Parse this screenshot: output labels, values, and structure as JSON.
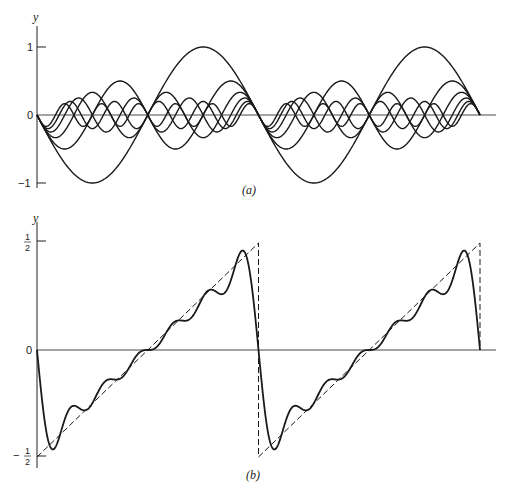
{
  "chart_data": [
    {
      "panel": "a",
      "type": "line",
      "title": "",
      "caption": "(a)",
      "ylabel": "y",
      "xlabel": "",
      "yticks": [
        "1",
        "0",
        "-1"
      ],
      "ylim": [
        -1,
        1
      ],
      "xlim_periods": 2,
      "description": "Fourier components of the sawtooth: y = -sin(n x)/n for n = 1..6 over two periods",
      "series": [
        {
          "name": "n=1",
          "n": 1,
          "amplitude": 1.0
        },
        {
          "name": "n=2",
          "n": 2,
          "amplitude": 0.5
        },
        {
          "name": "n=3",
          "n": 3,
          "amplitude": 0.333
        },
        {
          "name": "n=4",
          "n": 4,
          "amplitude": 0.25
        },
        {
          "name": "n=5",
          "n": 5,
          "amplitude": 0.2
        },
        {
          "name": "n=6",
          "n": 6,
          "amplitude": 0.167
        }
      ],
      "grid": false
    },
    {
      "panel": "b",
      "type": "line",
      "title": "",
      "caption": "(b)",
      "ylabel": "y",
      "xlabel": "",
      "yticks": [
        "1/2",
        "0",
        "-1/2"
      ],
      "ylim": [
        -0.5,
        0.5
      ],
      "xlim_periods": 2,
      "description": "Partial Fourier sum (solid) approximating sawtooth wave (dashed) rising from -1/2 to 1/2 each period",
      "series": [
        {
          "name": "sawtooth",
          "style": "dashed",
          "points_per_period": [
            [
              0,
              -0.5
            ],
            [
              1,
              0.5
            ]
          ]
        },
        {
          "name": "partial sum (6 terms)",
          "style": "solid",
          "terms": 6
        }
      ],
      "grid": false
    }
  ],
  "labels": {
    "a_y": "y",
    "a_caption": "(a)",
    "a_tick_1": "1",
    "a_tick_0": "0",
    "a_tick_m1": "−1",
    "b_y": "y",
    "b_caption": "(b)",
    "b_tick_0": "0",
    "b_half_num": "1",
    "b_half_den": "2",
    "b_minus": "−"
  }
}
